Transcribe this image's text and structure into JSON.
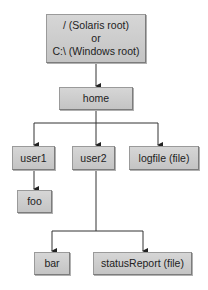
{
  "diagram": {
    "type": "directory-tree",
    "root": {
      "line1": "/ (Solaris root)",
      "line2": "or",
      "line3": "C:\\ (Windows root)"
    },
    "nodes": {
      "home": "home",
      "user1": "user1",
      "user2": "user2",
      "logfile": "logfile (file)",
      "foo": "foo",
      "bar": "bar",
      "statusReport": "statusReport (file)"
    },
    "edges": [
      [
        "root",
        "home"
      ],
      [
        "home",
        "user1"
      ],
      [
        "home",
        "user2"
      ],
      [
        "home",
        "logfile"
      ],
      [
        "user1",
        "foo"
      ],
      [
        "user2",
        "bar"
      ],
      [
        "user2",
        "statusReport"
      ]
    ],
    "colors": {
      "box": "#c8c8c8",
      "border": "#7c7c7c",
      "line": "#222222"
    }
  }
}
